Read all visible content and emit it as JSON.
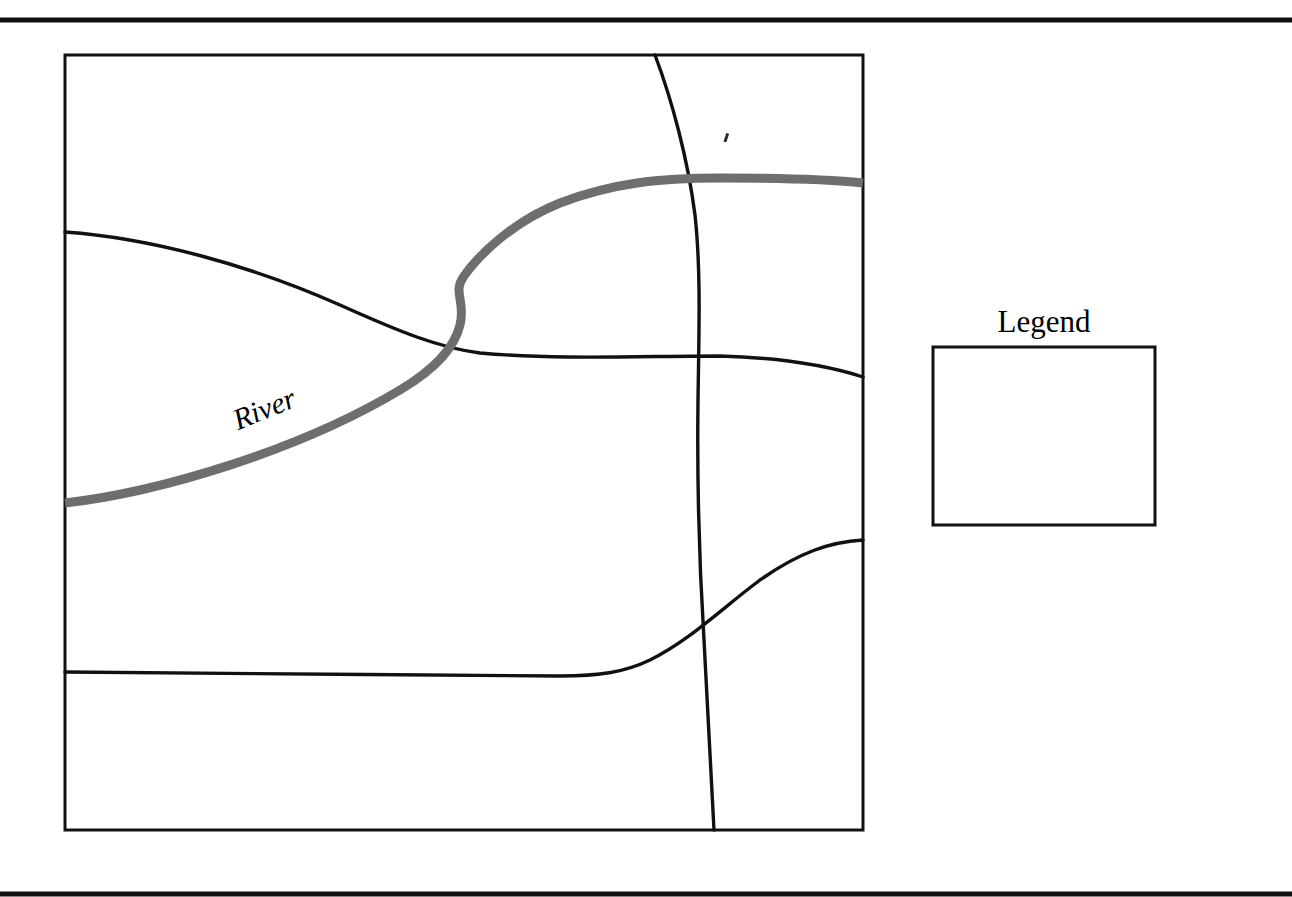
{
  "figure": {
    "background_color": "#ffffff",
    "ink_color": "#111111",
    "river_color": "#6e6e6e",
    "width": 1292,
    "height": 897
  },
  "rules": {
    "top": {
      "name": "top-rule",
      "y": 20,
      "thickness": 5,
      "x1": 0,
      "x2": 1292
    },
    "bottom": {
      "name": "bottom-rule",
      "y": 894,
      "thickness": 5,
      "x1": 0,
      "x2": 1292
    }
  },
  "map": {
    "frame": {
      "x": 65,
      "y": 55,
      "width": 798,
      "height": 775
    },
    "river": {
      "label": "River",
      "label_x": 268,
      "label_y": 418,
      "label_rotation": -22,
      "stroke_width": 9,
      "color": "#6e6e6e",
      "path": "M 65 503 C 160 492 300 450 400 390 C 440 366 455 345 460 325 C 466 300 452 293 464 276 C 478 256 512 222 560 203 C 612 183 660 178 720 178 C 790 178 835 180 863 183"
    },
    "boundaries": [
      {
        "name": "northern-boundary",
        "path": "M 65 232 C 150 238 250 265 340 305 C 400 332 440 348 480 353 C 560 360 640 356 720 356 C 790 358 835 368 863 377"
      },
      {
        "name": "meridian-boundary",
        "path": "M 655 55 C 672 100 688 160 695 215 C 701 270 699 330 698 400 C 697 480 699 560 704 640 C 708 720 712 790 714 830"
      },
      {
        "name": "southern-boundary",
        "path": "M 65 672 C 200 673 400 675 560 676 C 600 676 625 672 650 660 C 690 640 720 610 760 580 C 800 552 830 542 863 540"
      }
    ]
  },
  "legend": {
    "title": "Legend",
    "title_x": 1044,
    "title_y": 332,
    "box": {
      "x": 933,
      "y": 347,
      "width": 222,
      "height": 178
    }
  },
  "artifacts": {
    "speck": {
      "x": 725,
      "y": 133,
      "width": 3,
      "height": 9
    }
  }
}
